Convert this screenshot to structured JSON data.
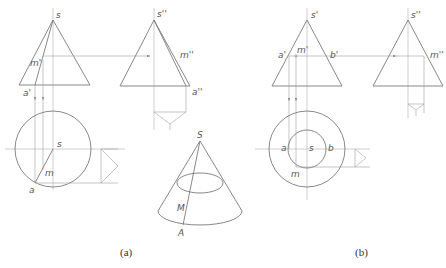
{
  "figure": {
    "panel_a": {
      "caption": "(a)",
      "front_view": {
        "apex": "s",
        "point_m": "m'",
        "point_a": "a'"
      },
      "side_view": {
        "apex": "s''",
        "point_m": "m''",
        "point_a": "a''"
      },
      "top_view": {
        "center": "s",
        "point_m": "m",
        "point_a": "a"
      },
      "pictorial": {
        "apex": "S",
        "point_M": "M",
        "point_A": "A"
      }
    },
    "panel_b": {
      "caption": "(b)",
      "front_view": {
        "apex": "s'",
        "point_a": "a'",
        "point_m": "m'",
        "point_b": "b'"
      },
      "side_view": {
        "apex": "s''",
        "point_m": "m''"
      },
      "top_view": {
        "center": "s",
        "point_a": "a",
        "point_b": "b",
        "point_m": "m"
      }
    }
  },
  "colors": {
    "line": "#7a7a7a",
    "construction": "#a0a0a0",
    "text": "#555555"
  }
}
